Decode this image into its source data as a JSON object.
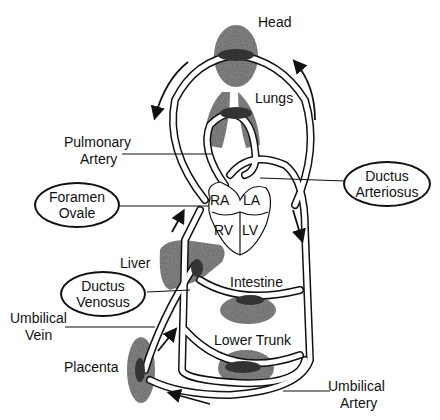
{
  "diagram": {
    "labels": {
      "head": "Head",
      "lungs": "Lungs",
      "pulmonary_artery_1": "Pulmonary",
      "pulmonary_artery_2": "Artery",
      "ra": "RA",
      "la": "LA",
      "rv": "RV",
      "lv": "LV",
      "liver": "Liver",
      "intestine": "Intestine",
      "umbilical_vein_1": "Umbilical",
      "umbilical_vein_2": "Vein",
      "lower_trunk": "Lower Trunk",
      "placenta": "Placenta",
      "umbilical_artery_1": "Umbilical",
      "umbilical_artery_2": "Artery"
    },
    "callouts": {
      "foramen_ovale_1": "Foramen",
      "foramen_ovale_2": "Ovale",
      "ductus_arteriosus_1": "Ductus",
      "ductus_arteriosus_2": "Arteriosus",
      "ductus_venosus_1": "Ductus",
      "ductus_venosus_2": "Venosus"
    },
    "colors": {
      "line": "#111111",
      "tissue": "#8a8a8a",
      "bg": "#ffffff"
    }
  }
}
